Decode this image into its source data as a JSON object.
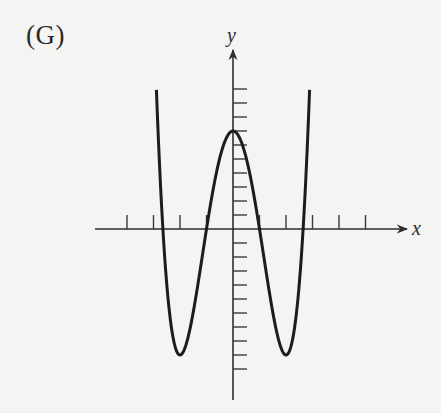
{
  "panel": {
    "label": "(G)"
  },
  "chart_data": {
    "type": "line",
    "title": "(G)",
    "xlabel": "x",
    "ylabel": "y",
    "function": "y = x^4 - 8x^2 + 7",
    "x_ticks": [
      -4,
      -3,
      -2,
      -1,
      1,
      2,
      3,
      4,
      5
    ],
    "y_ticks": [
      -10,
      -9,
      -8,
      -7,
      -6,
      -5,
      -4,
      -3,
      -2,
      -1,
      1,
      2,
      3,
      4,
      5,
      6,
      7,
      8,
      9,
      10
    ],
    "tick_labels_shown": false,
    "xlim": [
      -5.2,
      6.5
    ],
    "ylim": [
      -11,
      12.5
    ],
    "grid": false,
    "legend": null,
    "key_points": {
      "local_max": [
        0,
        7
      ],
      "local_min": [
        [
          -2,
          -9
        ],
        [
          2,
          -9
        ]
      ],
      "x_intercepts": [
        -2.65,
        -1,
        1,
        2.65
      ],
      "y_intercept": 7
    },
    "series": [
      {
        "name": "f(x)",
        "x": [
          -2.89,
          -2.75,
          -2.65,
          -2.5,
          -2.25,
          -2.0,
          -1.75,
          -1.5,
          -1.25,
          -1.0,
          -0.75,
          -0.5,
          -0.25,
          0,
          0.25,
          0.5,
          0.75,
          1.0,
          1.25,
          1.5,
          1.75,
          2.0,
          2.25,
          2.5,
          2.65,
          2.75,
          2.89
        ],
        "values": [
          10.0,
          4.7,
          0.0,
          -4.94,
          -7.87,
          -9.0,
          -8.12,
          -5.94,
          -3.06,
          0.0,
          2.82,
          5.06,
          6.5,
          7.0,
          6.5,
          5.06,
          2.82,
          0.0,
          -3.06,
          -5.94,
          -8.12,
          -9.0,
          -7.87,
          -4.94,
          0.0,
          4.7,
          10.0
        ]
      }
    ]
  },
  "layout": {
    "origin_px": [
      233,
      229
    ],
    "x_unit_px": 26.5,
    "y_unit_px": 14,
    "x_axis_px": [
      95,
      407
    ],
    "y_axis_px": [
      50,
      400
    ],
    "tick_len_px": 14
  }
}
